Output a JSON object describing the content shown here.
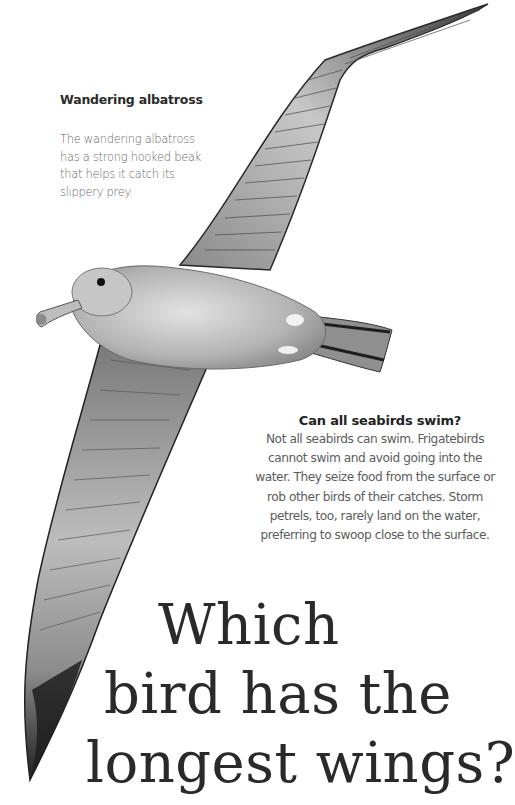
{
  "caption": {
    "title": "Wandering albatross",
    "body": "The wandering albatross has a strong hooked beak that helps it catch its slippery prey."
  },
  "qa": {
    "title": "Can all seabirds swim?",
    "body": "Not all seabirds can swim. Frigatebirds cannot swim and avoid going into the water. They seize food from the surface or rob other birds of their catches. Storm petrels, too, rarely land on the water, preferring to swoop close to the surface."
  },
  "headline": {
    "line1": "Which",
    "line2": "bird has the",
    "line3": "longest wings?"
  },
  "illustration": {
    "subject": "wandering-albatross-in-flight",
    "palette": [
      "#ffffff",
      "#d9d9d9",
      "#9a9a9a",
      "#4a4a4a",
      "#1e1e1e"
    ]
  }
}
